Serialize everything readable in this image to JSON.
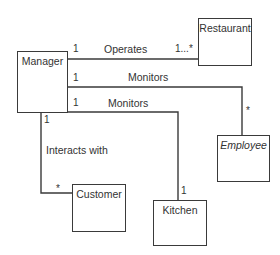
{
  "diagram": {
    "type": "UML class diagram",
    "classes": [
      {
        "id": "manager",
        "name": "Manager",
        "italic": false
      },
      {
        "id": "restaurant",
        "name": "Restaurant",
        "italic": false
      },
      {
        "id": "employee",
        "name": "Employee",
        "italic": true
      },
      {
        "id": "customer",
        "name": "Customer",
        "italic": false
      },
      {
        "id": "kitchen",
        "name": "Kitchen",
        "italic": false
      }
    ],
    "associations": [
      {
        "id": "operates",
        "from": "Manager",
        "to": "Restaurant",
        "label": "Operates",
        "from_mult": "1",
        "to_mult": "1...*"
      },
      {
        "id": "monitors_employee",
        "from": "Manager",
        "to": "Employee",
        "label": "Monitors",
        "from_mult": "1",
        "to_mult": "*"
      },
      {
        "id": "monitors_kitchen",
        "from": "Manager",
        "to": "Kitchen",
        "label": "Monitors",
        "from_mult": "1",
        "to_mult": "1"
      },
      {
        "id": "interacts",
        "from": "Manager",
        "to": "Customer",
        "label": "Interacts with",
        "from_mult": "1",
        "to_mult": "*"
      }
    ],
    "colors": {
      "line": "#3a3a3a",
      "text": "#333333",
      "background": "#ffffff"
    }
  }
}
